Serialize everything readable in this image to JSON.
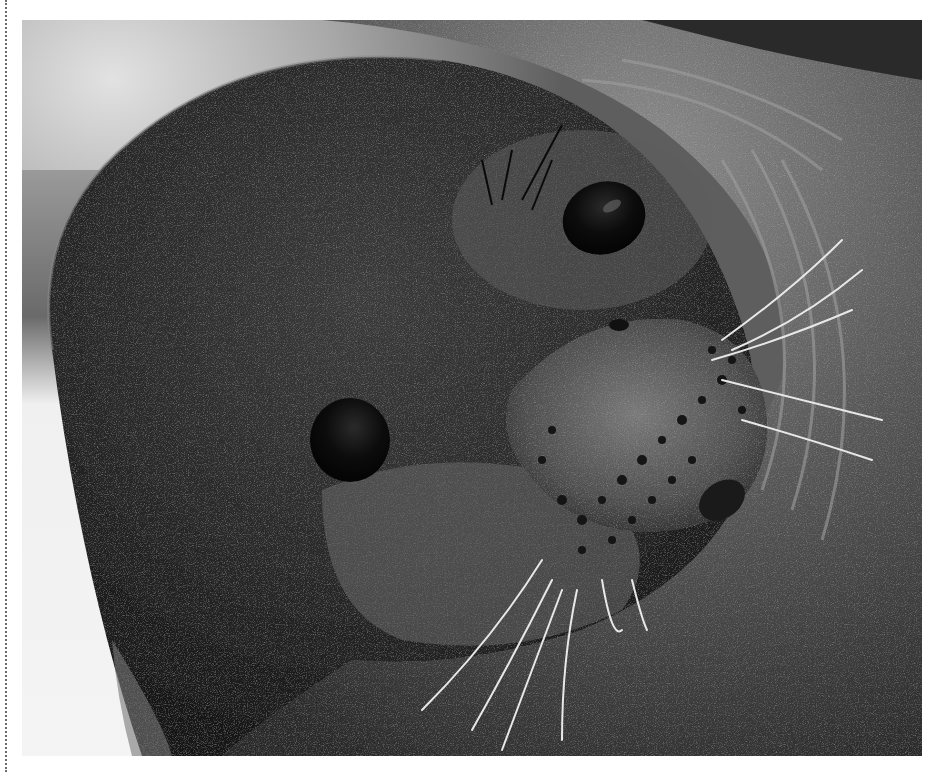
{
  "page": {
    "background": "#ffffff",
    "left_rule": {
      "style": "dotted",
      "color": "#6b6b6b"
    }
  },
  "photo": {
    "subject": "Close-up black-and-white photograph of a Weddell seal's face, head tilted, looking at the camera",
    "tone": "grayscale",
    "features": [
      "seal-head",
      "left-eye",
      "right-eye",
      "muzzle",
      "whiskers",
      "neck-folds",
      "blurred-background"
    ],
    "colors": {
      "background_light": "#dcdcdc",
      "background_mid": "#8c8c8c",
      "fur_dark": "#1e1e1e",
      "fur_mid": "#4a4a4a",
      "fur_light": "#8a8a8a",
      "eye": "#0a0a0a",
      "whisker": "#e8e8e8"
    }
  },
  "scan_mark": {
    "shape": "small handwritten D-like mark"
  }
}
